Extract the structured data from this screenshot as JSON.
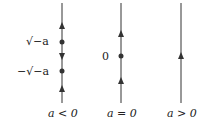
{
  "diagrams": [
    {
      "name": "a-less-than-zero",
      "caption": "a < 0",
      "labels": {
        "upper": "√−a",
        "lower": "−√−a"
      },
      "elements": [
        "arrow-up",
        "equilibrium",
        "arrow-down",
        "equilibrium",
        "arrow-up"
      ]
    },
    {
      "name": "a-equal-zero",
      "caption": "a = 0",
      "labels": {
        "eq": "0"
      },
      "elements": [
        "arrow-up",
        "equilibrium",
        "arrow-up"
      ]
    },
    {
      "name": "a-greater-than-zero",
      "caption": "a > 0",
      "elements": [
        "arrow-up"
      ]
    }
  ],
  "colors": {
    "line": "#333333"
  }
}
